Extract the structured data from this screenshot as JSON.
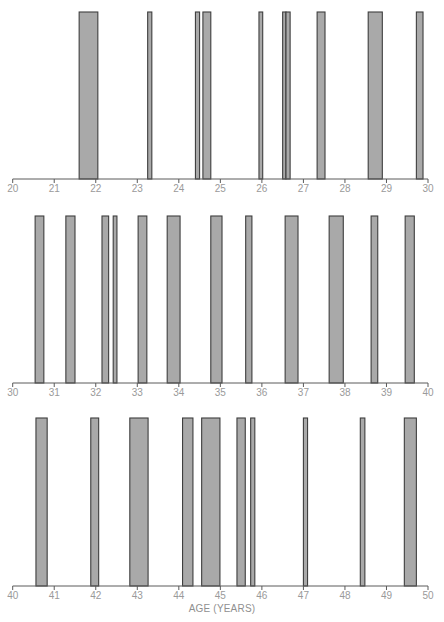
{
  "chart_data": [
    {
      "type": "bar",
      "panel": 1,
      "title": "",
      "xlabel": "",
      "ylabel": "",
      "xlim": [
        20,
        30
      ],
      "ticks": [
        20,
        21,
        22,
        23,
        24,
        25,
        26,
        27,
        28,
        29,
        30
      ],
      "bars": [
        {
          "start": 21.6,
          "end": 22.05
        },
        {
          "start": 23.25,
          "end": 23.35
        },
        {
          "start": 24.4,
          "end": 24.5
        },
        {
          "start": 24.58,
          "end": 24.77
        },
        {
          "start": 25.93,
          "end": 26.02
        },
        {
          "start": 26.5,
          "end": 26.58
        },
        {
          "start": 26.58,
          "end": 26.68
        },
        {
          "start": 27.33,
          "end": 27.52
        },
        {
          "start": 28.56,
          "end": 28.9
        },
        {
          "start": 29.72,
          "end": 29.88
        }
      ],
      "grid": false
    },
    {
      "type": "bar",
      "panel": 2,
      "title": "",
      "xlabel": "",
      "ylabel": "",
      "xlim": [
        30,
        40
      ],
      "ticks": [
        30,
        31,
        32,
        33,
        34,
        35,
        36,
        37,
        38,
        39,
        40
      ],
      "bars": [
        {
          "start": 30.54,
          "end": 30.75
        },
        {
          "start": 31.28,
          "end": 31.5
        },
        {
          "start": 32.15,
          "end": 32.31
        },
        {
          "start": 32.42,
          "end": 32.51
        },
        {
          "start": 33.02,
          "end": 33.23
        },
        {
          "start": 33.72,
          "end": 34.03
        },
        {
          "start": 34.77,
          "end": 35.04
        },
        {
          "start": 35.61,
          "end": 35.76
        },
        {
          "start": 36.56,
          "end": 36.87
        },
        {
          "start": 37.62,
          "end": 37.96
        },
        {
          "start": 38.63,
          "end": 38.79
        },
        {
          "start": 39.45,
          "end": 39.67
        }
      ],
      "grid": false
    },
    {
      "type": "bar",
      "panel": 3,
      "title": "",
      "xlabel": "AGE (YEARS)",
      "ylabel": "",
      "xlim": [
        40,
        50
      ],
      "ticks": [
        40,
        41,
        42,
        43,
        44,
        45,
        46,
        47,
        48,
        49,
        50
      ],
      "bars": [
        {
          "start": 40.56,
          "end": 40.83
        },
        {
          "start": 41.88,
          "end": 42.07
        },
        {
          "start": 42.82,
          "end": 43.26
        },
        {
          "start": 44.09,
          "end": 44.34
        },
        {
          "start": 44.55,
          "end": 44.99
        },
        {
          "start": 45.4,
          "end": 45.6
        },
        {
          "start": 45.73,
          "end": 45.83
        },
        {
          "start": 47.0,
          "end": 47.1
        },
        {
          "start": 48.37,
          "end": 48.48
        },
        {
          "start": 49.43,
          "end": 49.72
        }
      ],
      "grid": false
    }
  ],
  "labels": {
    "xaxis_title": "AGE (YEARS)"
  },
  "colors": {
    "bar_fill": "#a9a9a9",
    "bar_stroke": "#3e3e3e",
    "axis": "#5a5a5a",
    "tick_label": "#9a9a9a"
  }
}
